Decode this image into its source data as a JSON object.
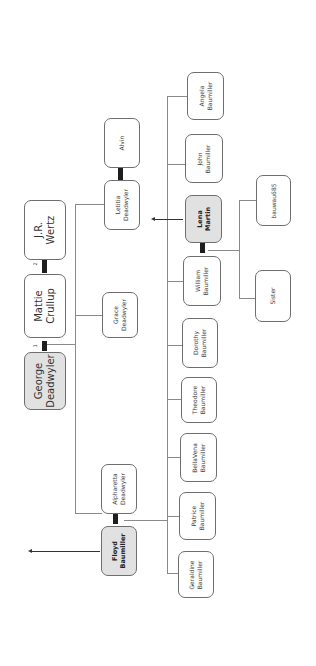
{
  "diagram": {
    "type": "family-tree",
    "orientation": "rotated",
    "colors": {
      "highlight_fill": "#e1e1e1",
      "node_border": "#6e6e6e",
      "connector": "#8a8a8a",
      "spouse_bar": "#1e1e1e"
    },
    "people": {
      "jr_wertz": "J.R.\nWertz",
      "mattie_crullup": "Mattie\nCrullup",
      "george_deadwyler": "George\nDeadwyler",
      "letitia_deadwyler": "Letitia\nDeadwyler",
      "alvin": "Alvin",
      "grace_deadwyler": "Grace\nDeadwyler",
      "alpharetta_deadwyler": "Alpharetta\nDeadwyler",
      "floyd_baumiller": "Floyd\nBaumiller",
      "angela_baumiller": "Angela\nBaumiller",
      "john_baumiller": "John\nBaumiller",
      "lena_martin": "Lena\nMartin",
      "william_baumiller": "William\nBaumiller",
      "dorothy_baumiller": "Dorothy\nBaumiller",
      "theodore_baumiller": "Theodore\nBaumiller",
      "bellavena_baumiller": "BellaVena\nBaumiller",
      "patrice_baumiller": "Patrice\nBaumiller",
      "geraldine_baumiller": "Geraldine\nBaumiller",
      "bauwau685": "bauwau685",
      "sister": "Sister"
    },
    "highlighted": [
      "george_deadwyler",
      "floyd_baumiller",
      "lena_martin"
    ],
    "marriage_markers": {
      "first": "1",
      "second": "2"
    },
    "relationships": [
      {
        "type": "spouse",
        "a": "george_deadwyler",
        "b": "mattie_crullup",
        "order": "1"
      },
      {
        "type": "spouse",
        "a": "mattie_crullup",
        "b": "jr_wertz",
        "order": "2"
      },
      {
        "type": "spouse",
        "a": "letitia_deadwyler",
        "b": "alvin"
      },
      {
        "type": "spouse",
        "a": "alpharetta_deadwyler",
        "b": "floyd_baumiller"
      },
      {
        "type": "spouse",
        "a": "william_baumiller",
        "b": "lena_martin"
      },
      {
        "type": "children",
        "parents": [
          "george_deadwyler",
          "mattie_crullup"
        ],
        "children": [
          "letitia_deadwyler",
          "grace_deadwyler",
          "alpharetta_deadwyler"
        ]
      },
      {
        "type": "children",
        "parents": [
          "alpharetta_deadwyler",
          "floyd_baumiller"
        ],
        "children": [
          "angela_baumiller",
          "john_baumiller",
          "william_baumiller",
          "dorothy_baumiller",
          "theodore_baumiller",
          "bellavena_baumiller",
          "patrice_baumiller",
          "geraldine_baumiller"
        ]
      },
      {
        "type": "children",
        "parents": [
          "william_baumiller",
          "lena_martin"
        ],
        "children": [
          "bauwau685",
          "sister"
        ]
      }
    ]
  }
}
